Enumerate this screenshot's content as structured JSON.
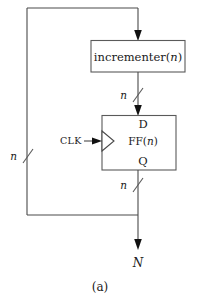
{
  "figure": {
    "caption": "(a)",
    "blocks": {
      "incrementer": {
        "label_prefix": "incrementer(",
        "label_var": "n",
        "label_suffix": ")"
      },
      "flipflop": {
        "label_prefix": "FF(",
        "label_var": "n",
        "label_suffix": ")",
        "pin_d": "D",
        "pin_q": "Q",
        "clock_label": "CLK"
      }
    },
    "bus_labels": {
      "incrementer_to_ff": "n",
      "ff_to_output": "n",
      "feedback": "n"
    },
    "output_label": "N",
    "colors": {
      "line": "#4a4a4a",
      "box_stroke": "#5a5a5a",
      "arrow_fill": "#111111",
      "text": "#1a1a1a",
      "background": "#ffffff"
    }
  }
}
